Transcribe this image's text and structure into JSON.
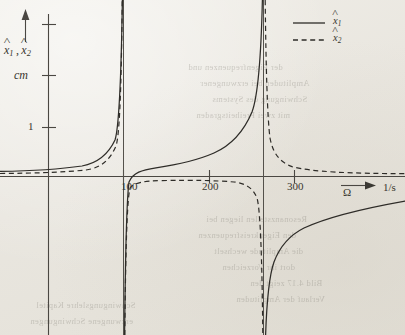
{
  "figure": {
    "background_color": "#ece9e3",
    "ink_color": "#2e2c28"
  },
  "axes": {
    "y_label_main": "x",
    "y_label_sub1": "1",
    "y_label_sub2": "2",
    "y_label_full": "x̂1 , x̂2",
    "y_unit": "cm",
    "y_tick_label": "1",
    "x_label": "Ω",
    "x_unit": "1/s",
    "x_tick_labels": [
      "100",
      "200",
      "300"
    ]
  },
  "legend": {
    "items": [
      {
        "style": "solid",
        "label_main": "x",
        "label_sub": "1"
      },
      {
        "style": "dashed",
        "label_main": "x",
        "label_sub": "2"
      }
    ]
  },
  "bleed_text": [
    {
      "text": "der Eigenfrequenzen und",
      "x": 188,
      "y": 62
    },
    {
      "text": "Amplituden bei erzwungener",
      "x": 200,
      "y": 78
    },
    {
      "text": "Schwingung des Systems",
      "x": 212,
      "y": 94
    },
    {
      "text": "mit zwei Freiheitsgraden",
      "x": 196,
      "y": 110
    },
    {
      "text": "Resonanzstellen liegen bei",
      "x": 206,
      "y": 214
    },
    {
      "text": "den Eigenkreisfrequenzen",
      "x": 198,
      "y": 230
    },
    {
      "text": "die Amplitude wechselt",
      "x": 214,
      "y": 246
    },
    {
      "text": "dort ihr Vorzeichen",
      "x": 222,
      "y": 262
    },
    {
      "text": "Bild 4.17 zeigt den",
      "x": 250,
      "y": 278
    },
    {
      "text": "Verlauf der Amplituden",
      "x": 236,
      "y": 294
    },
    {
      "text": "Schwingungslehre Kapitel",
      "x": 36,
      "y": 300
    },
    {
      "text": "erzwungene Schwingungen",
      "x": 30,
      "y": 316
    }
  ],
  "chart_data": {
    "type": "line",
    "title": "",
    "xlabel": "Ω",
    "xunit": "1/s",
    "ylabel": "x̂1 , x̂2",
    "yunit": "cm",
    "xlim": [
      0,
      330
    ],
    "ylim": [
      -3.4,
      3.1
    ],
    "xticks": [
      100,
      200,
      300
    ],
    "yticks": [
      1,
      2,
      3
    ],
    "grid": false,
    "legend_position": "top-right",
    "resonance_frequencies": [
      100,
      265
    ],
    "asymptotes_x": [
      100,
      265
    ],
    "series": [
      {
        "name": "x̂1",
        "style": "solid",
        "description": "Amplitude of mass 1: positive from 0 to 100 rising to +infinity at 100, jumps to -infinity, returns as positive branch from just above 100 rising to +infinity at 265, then from -infinity at 265 rising toward a positive asymptote at large frequency.",
        "points": [
          {
            "x": 0,
            "y": 0.1
          },
          {
            "x": 40,
            "y": 0.13
          },
          {
            "x": 70,
            "y": 0.22
          },
          {
            "x": 88,
            "y": 0.5
          },
          {
            "x": 95,
            "y": 1.2
          },
          {
            "x": 99,
            "y": 3.0
          },
          {
            "x": 101,
            "y": -3.4
          },
          {
            "x": 105,
            "y": -0.3
          },
          {
            "x": 110,
            "y": 0.15
          },
          {
            "x": 140,
            "y": 0.33
          },
          {
            "x": 180,
            "y": 0.52
          },
          {
            "x": 215,
            "y": 0.85
          },
          {
            "x": 240,
            "y": 1.45
          },
          {
            "x": 255,
            "y": 2.4
          },
          {
            "x": 262,
            "y": 3.05
          },
          {
            "x": 268,
            "y": -3.4
          },
          {
            "x": 280,
            "y": -1.8
          },
          {
            "x": 295,
            "y": -1.15
          },
          {
            "x": 310,
            "y": -0.8
          },
          {
            "x": 328,
            "y": -0.6
          }
        ]
      },
      {
        "name": "x̂2",
        "style": "dashed",
        "description": "Amplitude of mass 2: rises to +infinity at 100, re-enters from -infinity, stays slightly negative and nearly flat through the mid range, plunges to -infinity at 265, returns from +infinity at 265 and decays toward a small positive value.",
        "points": [
          {
            "x": 0,
            "y": 0.06
          },
          {
            "x": 50,
            "y": 0.09
          },
          {
            "x": 80,
            "y": 0.22
          },
          {
            "x": 92,
            "y": 0.8
          },
          {
            "x": 98,
            "y": 2.6
          },
          {
            "x": 99,
            "y": 3.05
          },
          {
            "x": 102,
            "y": -3.4
          },
          {
            "x": 106,
            "y": -0.9
          },
          {
            "x": 112,
            "y": -0.3
          },
          {
            "x": 130,
            "y": -0.17
          },
          {
            "x": 170,
            "y": -0.13
          },
          {
            "x": 210,
            "y": -0.14
          },
          {
            "x": 235,
            "y": -0.22
          },
          {
            "x": 250,
            "y": -0.45
          },
          {
            "x": 258,
            "y": -1.1
          },
          {
            "x": 263,
            "y": -3.4
          },
          {
            "x": 268,
            "y": 3.05
          },
          {
            "x": 272,
            "y": 1.4
          },
          {
            "x": 280,
            "y": 0.72
          },
          {
            "x": 295,
            "y": 0.4
          },
          {
            "x": 312,
            "y": 0.28
          },
          {
            "x": 328,
            "y": 0.22
          }
        ]
      }
    ]
  }
}
